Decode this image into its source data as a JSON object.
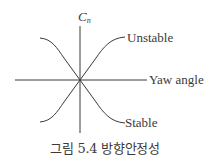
{
  "figure": {
    "y_axis_label": "C",
    "y_axis_label_subscript": "n",
    "x_axis_label": "Yaw angle",
    "curves": [
      {
        "name": "unstable",
        "label": "Unstable",
        "slope": "positive"
      },
      {
        "name": "stable",
        "label": "Stable",
        "slope": "negative"
      }
    ],
    "caption": "그림 5.4 방향안정성",
    "colors": {
      "line": "#3a3a3a",
      "text": "#3a3a3a",
      "background": "#ffffff"
    }
  }
}
